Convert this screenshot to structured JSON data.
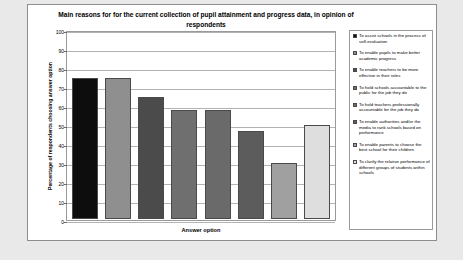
{
  "chart_data": {
    "type": "bar",
    "title": "Main reasons for for the current collection of pupil attainment and progress data, in opinion of respondents",
    "xlabel": "Answer option",
    "ylabel": "Percentage of respondents choosing answer option",
    "ylim": [
      0,
      100
    ],
    "ytick_step": 10,
    "yticks": [
      "100",
      "90",
      "80",
      "70",
      "60",
      "50",
      "40",
      "30",
      "20",
      "10",
      "0"
    ],
    "grid": true,
    "legend_position": "right",
    "categories": [
      "To assist schools in the process of self-evaluation",
      "To enable pupils to make better academic progress",
      "To enable teachers to be more effective in their roles",
      "To hold schools accountable to the public for the job they do",
      "To hold teachers professionally accountable for the job they do",
      "To enable authorities and/or the media to rank schools based on performance",
      "To enable parents to choose the best school for their children",
      "To clarify the relative performance of different groups of students within schools"
    ],
    "values": [
      75,
      75,
      65,
      58,
      58,
      47,
      30,
      50
    ],
    "colors": [
      "#0d0d0d",
      "#8f8f8f",
      "#4b4b4b",
      "#6f6f6f",
      "#6a6a6a",
      "#5c5c5c",
      "#a0a0a0",
      "#dedede"
    ]
  }
}
